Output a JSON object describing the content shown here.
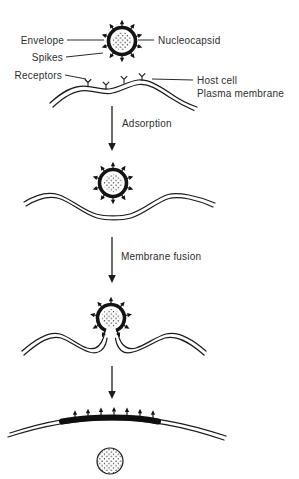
{
  "diagram": {
    "background": "#ffffff",
    "ink_color": "#1c1c1c",
    "text_color": "#2e2e2e",
    "virus_labels": {
      "envelope": "Envelope",
      "spikes": "Spikes",
      "nucleocapsid": "Nucleocapsid"
    },
    "cell_labels": {
      "receptors": "Receptors",
      "host_cell": "Host cell",
      "plasma_membrane": "Plasma membrane"
    },
    "steps": {
      "adsorption": "Adsorption",
      "membrane_fusion": "Membrane fusion"
    }
  }
}
